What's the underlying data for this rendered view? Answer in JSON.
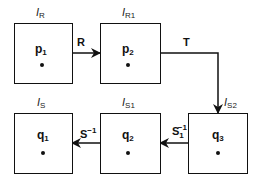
{
  "diagram": {
    "nodes": [
      {
        "id": "p1",
        "point": "p",
        "point_sub": "1",
        "domain": "I",
        "domain_sub": "R"
      },
      {
        "id": "p2",
        "point": "p",
        "point_sub": "2",
        "domain": "I",
        "domain_sub": "R1"
      },
      {
        "id": "q3",
        "point": "q",
        "point_sub": "3",
        "domain": "I",
        "domain_sub": "S2"
      },
      {
        "id": "q2",
        "point": "q",
        "point_sub": "2",
        "domain": "I",
        "domain_sub": "S1"
      },
      {
        "id": "q1",
        "point": "q",
        "point_sub": "1",
        "domain": "I",
        "domain_sub": "S"
      }
    ],
    "edges": [
      {
        "from": "p1",
        "to": "p2",
        "label": "R",
        "label_sub": "",
        "label_sup": ""
      },
      {
        "from": "p2",
        "to": "q3",
        "label": "T",
        "label_sub": "",
        "label_sup": ""
      },
      {
        "from": "q3",
        "to": "q2",
        "label": "S",
        "label_sub": "1",
        "label_sup": "−1"
      },
      {
        "from": "q2",
        "to": "q1",
        "label": "S",
        "label_sub": "",
        "label_sup": "−1"
      }
    ]
  }
}
